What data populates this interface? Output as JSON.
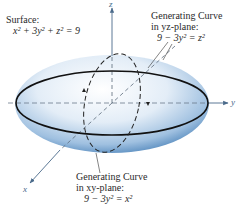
{
  "surface": {
    "title": "Surface:",
    "equation": "x² + 3y² + z² = 9"
  },
  "yz_curve": {
    "line1": "Generating Curve",
    "line2": "in yz-plane:",
    "equation": "9 − 3y² = z²"
  },
  "xy_curve": {
    "line1": "Generating Curve",
    "line2": "in xy-plane:",
    "equation": "9 − 3y² = x²"
  },
  "axes": {
    "x": "x",
    "y": "y",
    "z": "z"
  },
  "colors": {
    "ellipsoid_light": "#f4f8fc",
    "ellipsoid_mid": "#a9c6e3",
    "ellipsoid_dark": "#2f6fae",
    "outline": "#111111",
    "axis": "#4a6a8a"
  }
}
